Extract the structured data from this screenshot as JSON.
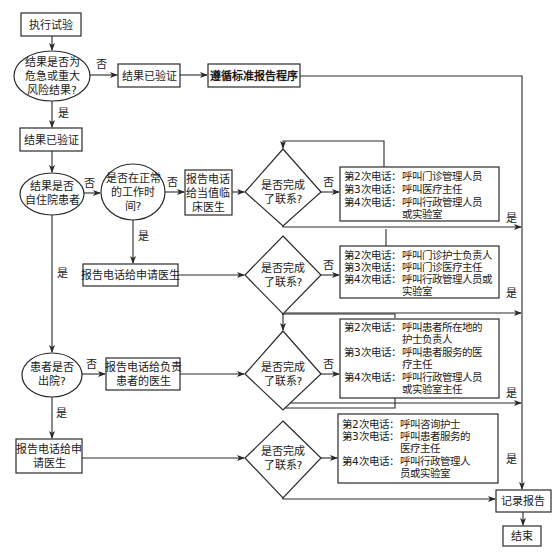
{
  "diagram": {
    "type": "flowchart",
    "colors": {
      "line": "#2a2a2a",
      "text": "#1a1a1a",
      "background": "#ffffff"
    },
    "edge_labels": {
      "yes": "是",
      "no": "否"
    },
    "nodes": {
      "start": {
        "shape": "rect",
        "lines": [
          "执行试验"
        ]
      },
      "q_critical": {
        "shape": "ellipse",
        "lines": [
          "结果是否为",
          "危急或重大",
          "风险结果?"
        ]
      },
      "verified_right": {
        "shape": "rect",
        "lines": [
          "结果已验证"
        ]
      },
      "standard_report": {
        "shape": "rect",
        "lines": [
          "遵循标准报告程序"
        ]
      },
      "verified_left": {
        "shape": "rect",
        "lines": [
          "结果已验证"
        ]
      },
      "q_inpatient": {
        "shape": "ellipse",
        "lines": [
          "结果是否",
          "自住院患者"
        ]
      },
      "q_work_hours": {
        "shape": "ellipse",
        "lines": [
          "是否在正常",
          "的工作时",
          "间?"
        ]
      },
      "call_oncall": {
        "shape": "rect",
        "lines": [
          "报告电话",
          "给当值临",
          "床医生"
        ]
      },
      "call_requester_mid": {
        "shape": "rect",
        "lines": [
          "报告电话给申请医生"
        ]
      },
      "q_discharged": {
        "shape": "ellipse",
        "lines": [
          "患者是否",
          "出院?"
        ]
      },
      "call_responsible": {
        "shape": "rect",
        "lines": [
          "报告电话给负责",
          "患者的医生"
        ]
      },
      "call_requester_bottom": {
        "shape": "rect",
        "lines": [
          "报告电话给申",
          "请医生"
        ]
      },
      "decision_1": {
        "shape": "diamond",
        "lines": [
          "是否完成",
          "了联系?"
        ]
      },
      "decision_2": {
        "shape": "diamond",
        "lines": [
          "是否完成",
          "了联系?"
        ]
      },
      "decision_3": {
        "shape": "diamond",
        "lines": [
          "是否完成",
          "了联系?"
        ]
      },
      "decision_4": {
        "shape": "diamond",
        "lines": [
          "是否完成",
          "了联系?"
        ]
      },
      "escalation_1": {
        "shape": "rect",
        "rows": [
          {
            "k": "第2次电话：",
            "v": [
              "呼叫门诊管理人员"
            ]
          },
          {
            "k": "第3次电话：",
            "v": [
              "呼叫医疗主任"
            ]
          },
          {
            "k": "第4次电话：",
            "v": [
              "呼叫行政管理人员",
              "或实验室"
            ]
          }
        ]
      },
      "escalation_2": {
        "shape": "rect",
        "rows": [
          {
            "k": "第2次电话：",
            "v": [
              "呼叫门诊护士负责人"
            ]
          },
          {
            "k": "第3次电话：",
            "v": [
              "呼叫门诊医疗主任"
            ]
          },
          {
            "k": "第4次电话：",
            "v": [
              "呼叫行政管理人员或",
              "实验室"
            ]
          }
        ]
      },
      "escalation_3": {
        "shape": "rect",
        "rows": [
          {
            "k": "第2次电话：",
            "v": [
              "呼叫患者所在地的",
              "护士负责人"
            ]
          },
          {
            "k": "第3次电话：",
            "v": [
              "呼叫患者服务的医",
              "疗主任"
            ]
          },
          {
            "k": "第4次电话：",
            "v": [
              "呼叫行政管理人员",
              "或实验室主任"
            ]
          }
        ]
      },
      "escalation_4": {
        "shape": "rect",
        "rows": [
          {
            "k": "第2次电话：",
            "v": [
              "呼叫咨询护士"
            ]
          },
          {
            "k": "第3次电话：",
            "v": [
              "呼叫患者服务的",
              "医疗主任"
            ]
          },
          {
            "k": "第4次电话：",
            "v": [
              "呼叫行政管理人",
              "员或实验室"
            ]
          }
        ]
      },
      "record_report": {
        "shape": "rect",
        "lines": [
          "记录报告"
        ]
      },
      "end": {
        "shape": "rect",
        "lines": [
          "结束"
        ]
      }
    }
  }
}
